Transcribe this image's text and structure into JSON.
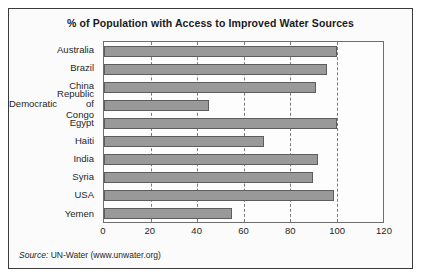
{
  "chart_data": {
    "type": "bar",
    "orientation": "horizontal",
    "title": "% of Population with Access to Improved Water Sources",
    "xlabel": "",
    "ylabel": "",
    "xlim": [
      0,
      120
    ],
    "xticks": [
      0,
      20,
      40,
      60,
      80,
      100,
      120
    ],
    "grid": true,
    "grid_axis": "x",
    "grid_style": "dashed",
    "legend": null,
    "categories": [
      "Australia",
      "Brazil",
      "China",
      "Democratic Republic of Congo",
      "Egypt",
      "Haiti",
      "India",
      "Syria",
      "USA",
      "Yemen"
    ],
    "category_lines": [
      [
        "Australia"
      ],
      [
        "Brazil"
      ],
      [
        "China"
      ],
      [
        "Democratic",
        "Republic of Congo"
      ],
      [
        "Egypt"
      ],
      [
        "Haiti"
      ],
      [
        "India"
      ],
      [
        "Syria"
      ],
      [
        "USA"
      ],
      [
        "Yemen"
      ]
    ],
    "values": [
      100,
      96,
      91,
      45,
      100,
      69,
      92,
      90,
      99,
      55
    ],
    "bar_color": "#999999",
    "bar_edge_color": "#5d5d5d"
  },
  "source": {
    "label": "Source:",
    "text": " UN-Water (www.unwater.org)"
  },
  "colors": {
    "frame": "#3c3c3c",
    "plot_border": "#6e6e6e",
    "grid": "#7a7a7a",
    "text": "#1f1f1f",
    "background": "#fbfbfb"
  }
}
